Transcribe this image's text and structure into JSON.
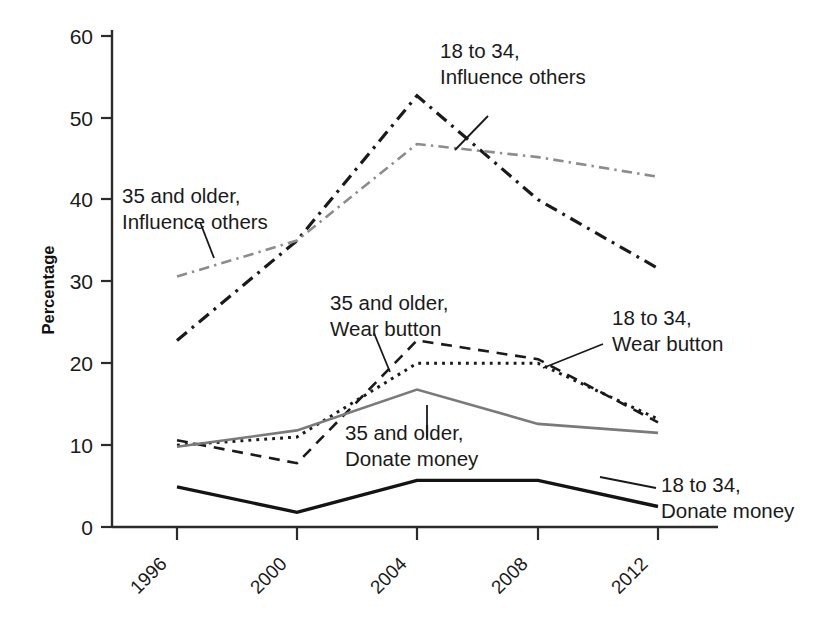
{
  "chart_data": {
    "type": "line",
    "title": "",
    "xlabel": "",
    "ylabel": "Percentage",
    "categories": [
      "1996",
      "2000",
      "2004",
      "2008",
      "2012"
    ],
    "x": [
      1996,
      2000,
      2004,
      2008,
      2012
    ],
    "ylim": [
      0,
      60
    ],
    "yticks": [
      0,
      10,
      20,
      30,
      40,
      50,
      60
    ],
    "ytick_labels": [
      "0",
      "10",
      "20",
      "30",
      "40",
      "50",
      "60"
    ],
    "grid": false,
    "legend_position": "inline-annotations",
    "series": [
      {
        "name": "18 to 34, Influence others",
        "values": [
          22.8,
          35.0,
          52.7,
          40.0,
          31.6
        ],
        "color": "#1a1a1a",
        "style": "dash-dot",
        "width": 3.2
      },
      {
        "name": "35 and older, Influence others",
        "values": [
          30.6,
          35.0,
          46.8,
          45.2,
          42.8
        ],
        "color": "#8c8c8c",
        "style": "dash-dot",
        "width": 2.6
      },
      {
        "name": "35 and older, Wear button",
        "values": [
          10.6,
          7.8,
          22.8,
          20.5,
          12.8
        ],
        "color": "#1a1a1a",
        "style": "dashed",
        "width": 2.6
      },
      {
        "name": "18 to 34, Wear button",
        "values": [
          10.0,
          11.0,
          20.0,
          20.0,
          13.2
        ],
        "color": "#1a1a1a",
        "style": "dotted",
        "width": 3.0
      },
      {
        "name": "35 and older, Donate money",
        "values": [
          9.8,
          11.8,
          16.8,
          12.6,
          11.5
        ],
        "color": "#7a7a7a",
        "style": "solid",
        "width": 2.6
      },
      {
        "name": "18 to 34, Donate money",
        "values": [
          4.9,
          1.8,
          5.7,
          5.7,
          2.5
        ],
        "color": "#141414",
        "style": "solid",
        "width": 3.4
      }
    ],
    "annotations": [
      {
        "id": "ann-1834-influence",
        "line1": "18 to 34,",
        "line2": "Influence others"
      },
      {
        "id": "ann-35-influence",
        "line1": "35 and older,",
        "line2": "Influence others"
      },
      {
        "id": "ann-35-wear",
        "line1": "35 and older,",
        "line2": "Wear button"
      },
      {
        "id": "ann-1834-wear",
        "line1": "18 to 34,",
        "line2": "Wear button"
      },
      {
        "id": "ann-35-donate",
        "line1": "35 and older,",
        "line2": "Donate money"
      },
      {
        "id": "ann-1834-donate",
        "line1": "18 to 34,",
        "line2": "Donate money"
      }
    ]
  },
  "axis": {
    "y_label": "Percentage",
    "y_tick_60": "60",
    "y_tick_50": "50",
    "y_tick_40": "40",
    "y_tick_30": "30",
    "y_tick_20": "20",
    "y_tick_10": "10",
    "y_tick_0": "0",
    "x_tick_1996": "1996",
    "x_tick_2000": "2000",
    "x_tick_2004": "2004",
    "x_tick_2008": "2008",
    "x_tick_2012": "2012"
  }
}
